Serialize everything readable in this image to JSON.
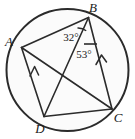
{
  "figure": {
    "background_color": "#ffffff",
    "stroke_color": "#2b2b2b",
    "circle_fill": "#fbfbfb",
    "label_color": "#1a1a1a"
  },
  "circle": {
    "name": "circumscribed-circle",
    "cx": 67.5,
    "cy": 70,
    "r": 61,
    "stroke_width": 2.0
  },
  "vertices": [
    {
      "id": "A",
      "label": "A",
      "x": 21.5,
      "y": 47.5,
      "label_x": 12,
      "label_y": 42
    },
    {
      "id": "B",
      "label": "B",
      "x": 88.5,
      "y": 17.5,
      "label_x": 93,
      "label_y": 12
    },
    {
      "id": "C",
      "label": "C",
      "x": 112.0,
      "y": 109.0,
      "label_x": 115,
      "label_y": 120
    },
    {
      "id": "D",
      "label": "D",
      "x": 44.0,
      "y": 116.5,
      "label_x": 37,
      "label_y": 131
    }
  ],
  "segments": [
    {
      "name": "segment-AB",
      "from": "A",
      "to": "B",
      "stroke_width": 1.6
    },
    {
      "name": "segment-BC",
      "from": "B",
      "to": "C",
      "stroke_width": 1.6,
      "parallel_mark": true
    },
    {
      "name": "segment-CD",
      "from": "C",
      "to": "D",
      "stroke_width": 1.6
    },
    {
      "name": "segment-DA",
      "from": "D",
      "to": "A",
      "stroke_width": 1.6,
      "parallel_mark": true
    },
    {
      "name": "diagonal-AC",
      "from": "A",
      "to": "C",
      "stroke_width": 1.6
    },
    {
      "name": "diagonal-BD",
      "from": "B",
      "to": "D",
      "stroke_width": 1.6
    }
  ],
  "parallel_marks": [
    {
      "name": "parallel-arrow-on-DA",
      "on_segment": "segment-DA",
      "tip_x": 34.5,
      "tip_y": 68.0,
      "angle_deg": 249
    },
    {
      "name": "parallel-arrow-on-BC",
      "on_segment": "segment-BC",
      "tip_x": 101.0,
      "tip_y": 56.0,
      "angle_deg": 255
    }
  ],
  "angles": [
    {
      "name": "angle-ABD",
      "label": "32°",
      "value": 32,
      "unit": "degrees",
      "vertex": "B",
      "rays": [
        "A",
        "D"
      ],
      "label_x": 74,
      "label_y": 37,
      "arc_d": "M 76.5 27.5 A 14 14 0 0 1 85.0 31.5"
    },
    {
      "name": "angle-DBC",
      "label": "53°",
      "value": 53,
      "unit": "degrees",
      "vertex": "B",
      "rays": [
        "D",
        "C"
      ],
      "label_x": 80,
      "label_y": 55,
      "arc_d": "M 83.5 44.5 L 97.5 44.5"
    }
  ]
}
